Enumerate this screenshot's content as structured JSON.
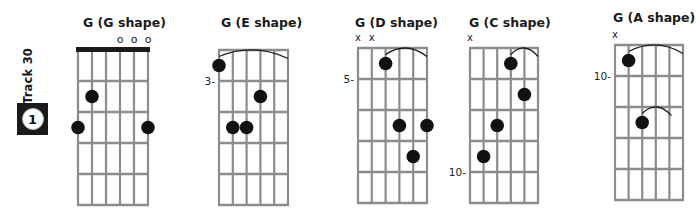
{
  "track": {
    "label": "Track 30",
    "number": "1"
  },
  "colors": {
    "ink": "#1a1a1a",
    "grid": "#8c8c8c",
    "background": "#ffffff"
  },
  "chords": [
    {
      "title": "G (G shape)",
      "name": "G",
      "shape": "G shape",
      "x": 78,
      "y": 50,
      "w": 70,
      "fret_h": 31,
      "frets": 5,
      "title_x": 83,
      "title_y": 15,
      "nut": true,
      "position_label": "",
      "position_fret_line": 0,
      "open_strings": [
        4,
        5,
        6
      ],
      "muted_strings": [],
      "dots": [
        {
          "string": 2,
          "fret": 2
        },
        {
          "string": 1,
          "fret": 3
        },
        {
          "string": 6,
          "fret": 3
        }
      ],
      "barres": []
    },
    {
      "title": "G (E shape)",
      "name": "G",
      "shape": "E shape",
      "x": 219,
      "y": 50,
      "w": 69,
      "fret_h": 31,
      "frets": 5,
      "title_x": 221,
      "title_y": 15,
      "nut": false,
      "position_label": "3-",
      "position_fret_line": 1,
      "open_strings": [],
      "muted_strings": [],
      "dots": [
        {
          "string": 1,
          "fret": 1
        },
        {
          "string": 4,
          "fret": 2
        },
        {
          "string": 2,
          "fret": 3
        },
        {
          "string": 3,
          "fret": 3
        }
      ],
      "barres": [
        {
          "fret": 1,
          "from": 1,
          "to": 6
        }
      ]
    },
    {
      "title": "G (D shape)",
      "name": "G",
      "shape": "D shape",
      "x": 358,
      "y": 48,
      "w": 69,
      "fret_h": 31,
      "frets": 5,
      "title_x": 355,
      "title_y": 15,
      "nut": false,
      "position_label": "5-",
      "position_fret_line": 1,
      "open_strings": [],
      "muted_strings": [
        1,
        2
      ],
      "dots": [
        {
          "string": 3,
          "fret": 1
        },
        {
          "string": 4,
          "fret": 3
        },
        {
          "string": 6,
          "fret": 3
        },
        {
          "string": 5,
          "fret": 4
        }
      ],
      "barres": [
        {
          "fret": 1,
          "from": 3,
          "to": 6
        }
      ]
    },
    {
      "title": "G (C shape)",
      "name": "G",
      "shape": "C shape",
      "x": 470,
      "y": 48,
      "w": 68,
      "fret_h": 31,
      "frets": 5,
      "title_x": 469,
      "title_y": 15,
      "nut": false,
      "position_label": "10-",
      "position_fret_line": 4,
      "open_strings": [],
      "muted_strings": [
        1
      ],
      "dots": [
        {
          "string": 4,
          "fret": 1
        },
        {
          "string": 5,
          "fret": 2
        },
        {
          "string": 3,
          "fret": 3
        },
        {
          "string": 2,
          "fret": 4
        }
      ],
      "barres": [
        {
          "fret": 1,
          "from": 4,
          "to": 6
        }
      ]
    },
    {
      "title": "G (A shape)",
      "name": "G",
      "shape": "A shape",
      "x": 615,
      "y": 45,
      "w": 68,
      "fret_h": 31,
      "frets": 5,
      "title_x": 613,
      "title_y": 10,
      "nut": false,
      "position_label": "10-",
      "position_fret_line": 1,
      "open_strings": [],
      "muted_strings": [
        1
      ],
      "dots": [
        {
          "string": 2,
          "fret": 1
        },
        {
          "string": 3,
          "fret": 3
        }
      ],
      "barres": [
        {
          "fret": 1,
          "from": 2,
          "to": 6
        },
        {
          "fret": 3,
          "from": 3,
          "to": 5
        }
      ]
    }
  ],
  "symbols": {
    "open": "o",
    "muted": "x"
  }
}
